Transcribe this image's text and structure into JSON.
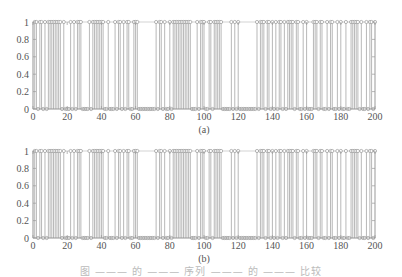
{
  "chart_data": [
    {
      "type": "stem",
      "label": "(a)",
      "title": "",
      "xlabel": "",
      "ylabel": "",
      "xlim": [
        0,
        200
      ],
      "ylim": [
        0,
        1
      ],
      "xticks": [
        0,
        20,
        40,
        60,
        80,
        100,
        120,
        140,
        160,
        180,
        200
      ],
      "yticks": [
        0,
        0.2,
        0.4,
        0.6,
        0.8,
        1
      ],
      "ytick_labels": [
        "0",
        "0.2",
        "0.4",
        "0.6",
        "0.8",
        "1"
      ],
      "grid": false,
      "marker": "circle-open",
      "values": [
        1,
        1,
        0,
        1,
        1,
        0,
        1,
        0,
        1,
        1,
        1,
        1,
        1,
        1,
        1,
        1,
        0,
        1,
        0,
        0,
        0,
        1,
        0,
        1,
        0,
        1,
        1,
        1,
        0,
        0,
        0,
        0,
        1,
        0,
        1,
        1,
        1,
        1,
        1,
        1,
        1,
        0,
        0,
        1,
        0,
        0,
        0,
        1,
        0,
        1,
        1,
        0,
        1,
        0,
        1,
        1,
        0,
        0,
        1,
        1,
        1,
        0,
        0,
        0,
        0,
        0,
        0,
        0,
        0,
        0,
        0,
        1,
        0,
        1,
        1,
        0,
        1,
        0,
        0,
        1,
        0,
        1,
        1,
        1,
        1,
        1,
        1,
        1,
        1,
        1,
        1,
        1,
        0,
        0,
        0,
        1,
        0,
        1,
        1,
        1,
        0,
        0,
        1,
        1,
        0,
        1,
        1,
        1,
        1,
        1,
        0,
        0,
        0,
        0,
        0,
        1,
        0,
        1,
        0,
        1,
        0,
        0,
        0,
        0,
        0,
        0,
        0,
        0,
        0,
        0,
        1,
        0,
        1,
        1,
        1,
        0,
        1,
        1,
        0,
        1,
        0,
        1,
        0,
        1,
        1,
        0,
        1,
        0,
        1,
        1,
        1,
        1,
        0,
        1,
        1,
        0,
        0,
        1,
        0,
        1,
        0,
        0,
        0,
        1,
        1,
        1,
        0,
        1,
        1,
        0,
        0,
        1,
        0,
        1,
        1,
        0,
        0,
        1,
        0,
        1,
        0,
        0,
        1,
        0,
        0,
        1,
        1,
        1,
        1,
        1,
        0,
        1,
        0,
        0,
        1,
        0,
        1,
        1,
        0,
        1
      ]
    },
    {
      "type": "stem",
      "label": "(b)",
      "title": "",
      "xlabel": "",
      "ylabel": "",
      "xlim": [
        0,
        200
      ],
      "ylim": [
        0,
        1
      ],
      "xticks": [
        0,
        20,
        40,
        60,
        80,
        100,
        120,
        140,
        160,
        180,
        200
      ],
      "yticks": [
        0,
        0.2,
        0.4,
        0.6,
        0.8,
        1
      ],
      "ytick_labels": [
        "0",
        "0.2",
        "0.4",
        "0.6",
        "0.8",
        "1"
      ],
      "grid": false,
      "marker": "circle-open",
      "values": [
        1,
        1,
        0,
        1,
        1,
        0,
        1,
        0,
        1,
        1,
        1,
        1,
        1,
        1,
        1,
        1,
        0,
        1,
        0,
        0,
        0,
        1,
        0,
        1,
        0,
        1,
        1,
        1,
        0,
        0,
        0,
        0,
        1,
        0,
        1,
        1,
        1,
        1,
        1,
        1,
        1,
        0,
        0,
        1,
        0,
        0,
        0,
        1,
        0,
        1,
        1,
        0,
        1,
        0,
        1,
        1,
        0,
        0,
        1,
        1,
        1,
        0,
        0,
        0,
        0,
        0,
        0,
        0,
        0,
        0,
        0,
        1,
        0,
        1,
        1,
        0,
        1,
        0,
        0,
        1,
        0,
        1,
        1,
        1,
        1,
        1,
        1,
        1,
        1,
        1,
        1,
        1,
        0,
        0,
        0,
        1,
        0,
        1,
        1,
        1,
        0,
        0,
        1,
        1,
        0,
        1,
        1,
        1,
        1,
        1,
        0,
        0,
        0,
        0,
        0,
        1,
        0,
        1,
        0,
        1,
        0,
        0,
        0,
        0,
        0,
        0,
        0,
        0,
        0,
        0,
        1,
        0,
        1,
        1,
        1,
        0,
        1,
        1,
        0,
        1,
        0,
        1,
        0,
        1,
        1,
        0,
        1,
        0,
        1,
        1,
        1,
        1,
        0,
        1,
        1,
        0,
        0,
        1,
        0,
        1,
        0,
        0,
        0,
        1,
        1,
        1,
        0,
        1,
        1,
        0,
        0,
        1,
        0,
        1,
        1,
        0,
        0,
        1,
        0,
        1,
        0,
        0,
        1,
        0,
        0,
        1,
        1,
        1,
        1,
        1,
        0,
        1,
        0,
        0,
        1,
        0,
        1,
        1,
        0,
        1
      ]
    }
  ],
  "panels": [
    {
      "label": "(a)"
    },
    {
      "label": "(b)"
    }
  ],
  "caption": "图 ——— 的 ——— 序列 ——— 的 ——— 比较"
}
